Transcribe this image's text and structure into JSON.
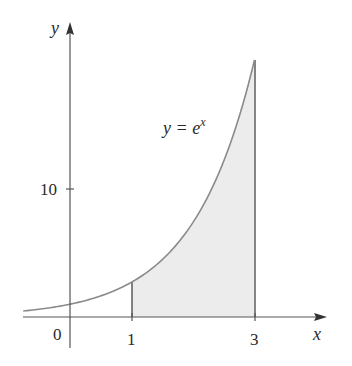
{
  "chart_data": {
    "type": "area",
    "title": "",
    "function_label": "y = e^x",
    "xlabel": "x",
    "ylabel": "y",
    "x_ticks": [
      "0",
      "1",
      "3"
    ],
    "y_ticks": [
      "10"
    ],
    "curve": {
      "expr": "e^x",
      "x_range": [
        -0.76,
        3
      ]
    },
    "shaded_region": {
      "x_from": 1,
      "x_to": 3,
      "under": "y = e^x"
    },
    "sample_points": [
      {
        "x": -0.75,
        "y": 0.47
      },
      {
        "x": 0,
        "y": 1.0
      },
      {
        "x": 1,
        "y": 2.72
      },
      {
        "x": 2,
        "y": 7.39
      },
      {
        "x": 3,
        "y": 20.09
      }
    ],
    "xlim": [
      -0.76,
      4.1
    ],
    "ylim": [
      0,
      21
    ],
    "grid": false,
    "colors": {
      "curve": "#8a8a8a",
      "shade": "#ececec",
      "axis": "#555555"
    }
  },
  "labels": {
    "y_axis": "y",
    "x_axis": "x",
    "origin": "0",
    "tick_1": "1",
    "tick_3": "3",
    "tick_10": "10",
    "eq_lhs": "y = e",
    "eq_sup": "x"
  }
}
